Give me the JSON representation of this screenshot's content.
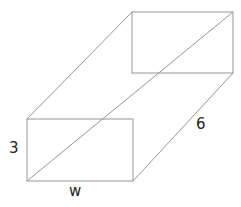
{
  "diagram": {
    "type": "rectangular-prism",
    "labels": {
      "height": "3",
      "width": "w",
      "length": "6"
    },
    "colors": {
      "stroke": "#8a8a8a",
      "text": "#222222"
    }
  }
}
